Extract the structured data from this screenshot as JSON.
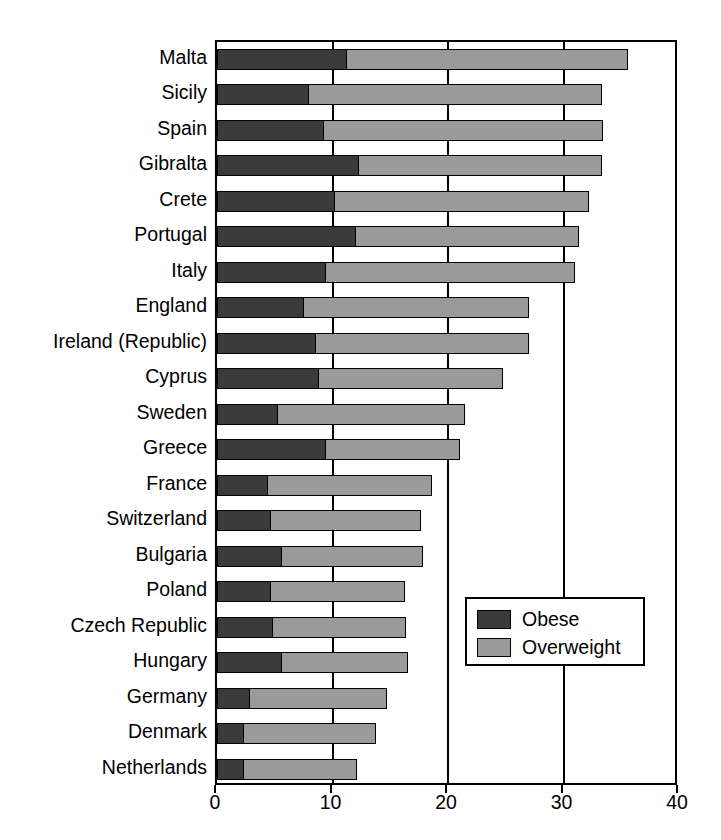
{
  "chart_data": {
    "type": "bar",
    "orientation": "horizontal",
    "stacked": true,
    "title": "",
    "subtitle": "",
    "xlabel": "",
    "ylabel": "",
    "xlim": [
      0,
      40
    ],
    "xticks": [
      0,
      10,
      20,
      30,
      40
    ],
    "xtick_labels": [
      "0",
      "10",
      "20",
      "30",
      "40"
    ],
    "grid": true,
    "grid_axis": "x",
    "legend_position": "lower-right-inside",
    "categories": [
      "Malta",
      "Sicily",
      "Spain",
      "Gibralta",
      "Crete",
      "Portugal",
      "Italy",
      "England",
      "Ireland (Republic)",
      "Cyprus",
      "Sweden",
      "Greece",
      "France",
      "Switzerland",
      "Bulgaria",
      "Poland",
      "Czech Republic",
      "Hungary",
      "Germany",
      "Denmark",
      "Netherlands"
    ],
    "series": [
      {
        "name": "Obese",
        "color": "#3a3a3a",
        "values": [
          11.3,
          8.0,
          9.3,
          12.3,
          10.3,
          12.1,
          9.5,
          7.6,
          8.6,
          8.9,
          5.3,
          9.5,
          4.5,
          4.7,
          5.7,
          4.7,
          4.9,
          5.7,
          2.9,
          2.4,
          2.4
        ]
      },
      {
        "name": "Overweight",
        "color": "#9a9a9a",
        "values": [
          24.3,
          25.3,
          24.1,
          21.0,
          21.9,
          19.2,
          21.5,
          19.4,
          18.4,
          15.9,
          16.2,
          11.5,
          14.1,
          13.0,
          12.1,
          11.6,
          11.5,
          10.8,
          11.8,
          11.4,
          9.7
        ]
      }
    ],
    "totals": [
      35.6,
      33.3,
      33.4,
      33.3,
      32.2,
      31.3,
      31.0,
      27.0,
      27.0,
      24.8,
      21.5,
      21.0,
      18.6,
      17.7,
      17.8,
      16.3,
      16.4,
      16.5,
      14.7,
      13.8,
      12.1
    ]
  },
  "legend": {
    "items": [
      {
        "label": "Obese",
        "swatch": "obese"
      },
      {
        "label": "Overweight",
        "swatch": "over"
      }
    ]
  },
  "colors": {
    "obese": "#3a3a3a",
    "overweight": "#9a9a9a",
    "axis": "#000000",
    "background": "#ffffff"
  }
}
